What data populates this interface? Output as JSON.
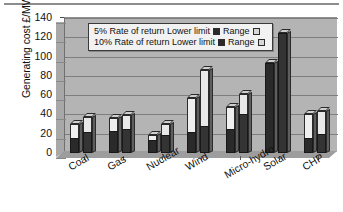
{
  "chart_data": {
    "type": "bar",
    "title": "",
    "xlabel": "",
    "ylabel": "Generating cost £/MWh",
    "ylim": [
      0,
      140
    ],
    "ytick_step": 20,
    "yticks": [
      "140",
      "120",
      "100",
      "80",
      "60",
      "40",
      "20",
      "0"
    ],
    "grid": true,
    "legend_position": "inside-top-center",
    "categories": [
      "Coal",
      "Gas",
      "Nuclear",
      "Wind",
      "Micro-hydro",
      "Solar",
      "CHP"
    ],
    "legend": [
      {
        "rate_label": "5% Rate of return Lower limit",
        "range_label": "Range",
        "lower_swatch": "dark",
        "range_swatch": "light"
      },
      {
        "rate_label": "10% Rate of return Lower limit",
        "range_label": "Range",
        "lower_swatch": "dark",
        "range_swatch": "light"
      }
    ],
    "series": [
      {
        "name": "5% Rate of return",
        "lower_limit": [
          16,
          23,
          13,
          22,
          25,
          93,
          16
        ],
        "upper_limit": [
          30,
          36,
          19,
          57,
          48,
          93,
          40
        ]
      },
      {
        "name": "10% Rate of return",
        "lower_limit": [
          22,
          25,
          19,
          28,
          40,
          124,
          20
        ],
        "upper_limit": [
          37,
          39,
          30,
          86,
          61,
          124,
          44
        ]
      }
    ],
    "colors": {
      "lower_limit": "#2a2a2a",
      "range": "#efefef",
      "plot_background": "#b4b4b4",
      "gridline": "#7e7e7e",
      "legend_background": "#f2f2f2"
    }
  }
}
